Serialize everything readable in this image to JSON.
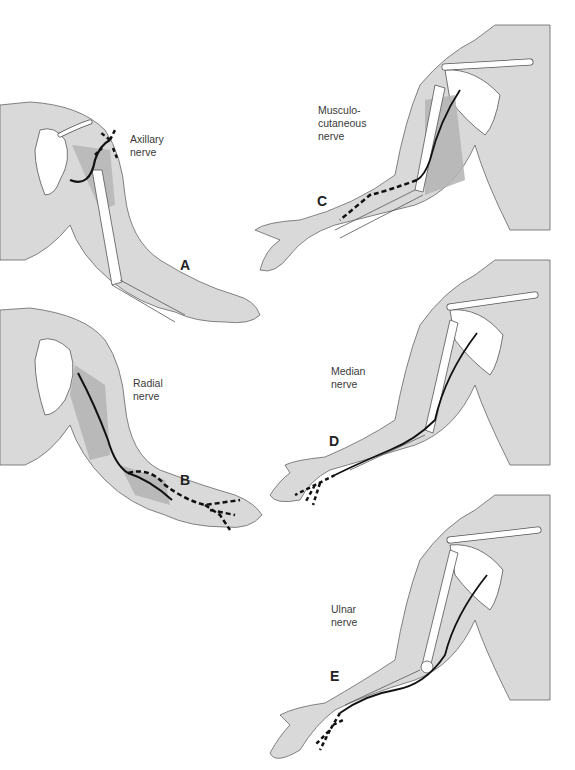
{
  "figure": {
    "panels": [
      {
        "id": "A",
        "letter": "A",
        "label_line1": "Axillary",
        "label_line2": "nerve",
        "label_line3": ""
      },
      {
        "id": "B",
        "letter": "B",
        "label_line1": "Radial",
        "label_line2": "nerve",
        "label_line3": ""
      },
      {
        "id": "C",
        "letter": "C",
        "label_line1": "Musculo-",
        "label_line2": "cutaneous",
        "label_line3": "nerve"
      },
      {
        "id": "D",
        "letter": "D",
        "label_line1": "Median",
        "label_line2": "nerve",
        "label_line3": ""
      },
      {
        "id": "E",
        "letter": "E",
        "label_line1": "Ulnar",
        "label_line2": "nerve",
        "label_line3": ""
      }
    ],
    "colors": {
      "skin": "#d9d9d9",
      "muscle_shade": "#b3b3b3",
      "bone": "#ffffff",
      "outline": "#555555",
      "nerve": "#111111"
    }
  }
}
